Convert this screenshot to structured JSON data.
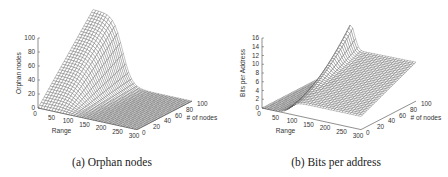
{
  "figure": {
    "captions": [
      "(a) Orphan nodes",
      "(b) Bits per address"
    ]
  },
  "chart_data": [
    {
      "type": "surface3d",
      "title": "(a) Orphan nodes",
      "xlabel": "Range",
      "ylabel": "# of nodes",
      "zlabel": "Orphan nodes",
      "x_ticks": [
        "0",
        "50",
        "100",
        "150",
        "200",
        "250",
        "300"
      ],
      "y_ticks": [
        "0",
        "20",
        "40",
        "60",
        "80",
        "100"
      ],
      "z_ticks": [
        "0",
        "20",
        "40",
        "60",
        "80",
        "100"
      ],
      "xlim": [
        0,
        300
      ],
      "ylim": [
        0,
        100
      ],
      "zlim": [
        0,
        100
      ],
      "description": "Orphan nodes near 100 at small range with many nodes, dropping sharply to ~0 beyond range ~100",
      "x": [
        0,
        25,
        50,
        75,
        100,
        125,
        150,
        200,
        250,
        300
      ],
      "series": [
        {
          "name": "# of nodes = 0",
          "values": [
            0,
            0,
            0,
            0,
            0,
            0,
            0,
            0,
            0,
            0
          ]
        },
        {
          "name": "# of nodes = 20",
          "values": [
            20,
            18,
            14,
            8,
            3,
            1,
            0,
            0,
            0,
            0
          ]
        },
        {
          "name": "# of nodes = 50",
          "values": [
            50,
            47,
            38,
            22,
            8,
            2,
            0,
            0,
            0,
            0
          ]
        },
        {
          "name": "# of nodes = 80",
          "values": [
            80,
            76,
            62,
            38,
            14,
            3,
            1,
            0,
            0,
            0
          ]
        },
        {
          "name": "# of nodes = 100",
          "values": [
            100,
            96,
            80,
            50,
            18,
            4,
            1,
            0,
            0,
            0
          ]
        }
      ]
    },
    {
      "type": "surface3d",
      "title": "(b) Bits per address",
      "xlabel": "Range",
      "ylabel": "# of nodes",
      "zlabel": "Bits per Address",
      "x_ticks": [
        "0",
        "50",
        "100",
        "150",
        "200",
        "250",
        "300"
      ],
      "y_ticks": [
        "0",
        "20",
        "40",
        "60",
        "80",
        "100"
      ],
      "z_ticks": [
        "0",
        "2",
        "4",
        "6",
        "8",
        "10",
        "12",
        "14",
        "16"
      ],
      "xlim": [
        0,
        300
      ],
      "ylim": [
        0,
        100
      ],
      "zlim": [
        0,
        16
      ],
      "description": "Bits per address peaks (~16) at range ~100 with many nodes, plateau ~8-9 at larger range, ~0 at small range",
      "x": [
        0,
        25,
        50,
        75,
        100,
        125,
        150,
        200,
        250,
        300
      ],
      "series": [
        {
          "name": "# of nodes = 0",
          "values": [
            0,
            0,
            0.5,
            1,
            2,
            2.5,
            3,
            3,
            3,
            3
          ]
        },
        {
          "name": "# of nodes = 20",
          "values": [
            0,
            0.5,
            1,
            3,
            5,
            5,
            5,
            5,
            5,
            5
          ]
        },
        {
          "name": "# of nodes = 50",
          "values": [
            0,
            0.5,
            1.5,
            5,
            9,
            8,
            7,
            7,
            7,
            7
          ]
        },
        {
          "name": "# of nodes = 80",
          "values": [
            0,
            1,
            2,
            7,
            13,
            10,
            8.5,
            8,
            8,
            8
          ]
        },
        {
          "name": "# of nodes = 100",
          "values": [
            0,
            1,
            2.5,
            8,
            16,
            11,
            9,
            8.5,
            8.5,
            8.5
          ]
        }
      ]
    }
  ]
}
